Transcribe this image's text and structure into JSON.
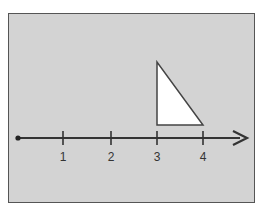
{
  "diagram": {
    "type": "number-line-with-triangle",
    "background_color": "#d3d3d3",
    "number_line": {
      "start_point": 0,
      "ticks": [
        {
          "value": 1,
          "label": "1",
          "x": 63
        },
        {
          "value": 2,
          "label": "2",
          "x": 111
        },
        {
          "value": 3,
          "label": "3",
          "x": 157
        },
        {
          "value": 4,
          "label": "4",
          "x": 203
        }
      ],
      "arrow": "right"
    },
    "shape": {
      "kind": "right-triangle",
      "fill": "#ffffff",
      "base_from": 3,
      "base_to": 4,
      "right_angle_at": 3
    }
  }
}
